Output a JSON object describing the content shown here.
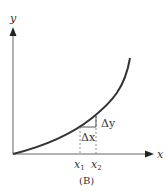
{
  "figure": {
    "caption": "(B)",
    "axes": {
      "x_label": "x",
      "y_label": "y"
    },
    "ticks": {
      "x1": "x",
      "x1_sub": "1",
      "x2": "x",
      "x2_sub": "2"
    },
    "annotations": {
      "delta_x": "Δx",
      "delta_y": "Δy"
    },
    "colors": {
      "curve": "#333333",
      "axis": "#555555",
      "dashed": "#666666"
    }
  }
}
